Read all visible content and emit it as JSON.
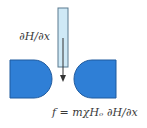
{
  "diagram": {
    "type": "magnetic-force-setup",
    "labels": {
      "gradient": "∂H/∂x",
      "formula": "f = mχHₒ ∂H/∂x"
    },
    "components": [
      {
        "name": "left-pole-piece",
        "shape": "flat-left-rounded-right"
      },
      {
        "name": "right-pole-piece",
        "shape": "rounded-left-flat-right"
      },
      {
        "name": "sample-tube",
        "shape": "vertical-tube"
      },
      {
        "name": "force-arrow",
        "direction": "down"
      }
    ],
    "colors": {
      "pole_fill": "#2f7fd6",
      "pole_stroke": "#1f5a9e",
      "tube_fill": "#cfe9f6",
      "tube_stroke": "#5a7a90",
      "arrow": "#333333",
      "text": "#3a3a3a"
    }
  }
}
